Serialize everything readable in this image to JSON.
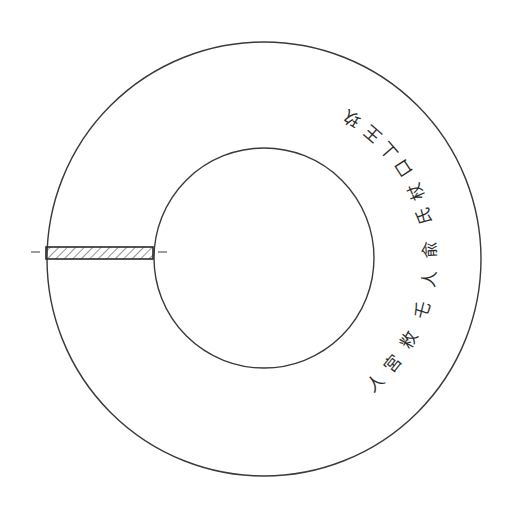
{
  "diagram": {
    "type": "bi-disc line drawing",
    "outer_ring": {
      "cx": 264,
      "cy": 259,
      "r": 217,
      "stroke": "#3a3a3a"
    },
    "inner_hole": {
      "cx": 264,
      "cy": 258,
      "r": 110,
      "stroke": "#3a3a3a"
    },
    "cross_section_bar": {
      "x1": 45,
      "x2": 153,
      "y": 247,
      "height": 12,
      "hatch": "diagonal"
    },
    "inscription": {
      "direction": "clockwise along right side of ring",
      "glyphs": [
        {
          "char": "玖",
          "angle": -58
        },
        {
          "char": "王",
          "angle": -49
        },
        {
          "char": "丄",
          "angle": -41
        },
        {
          "char": "口",
          "angle": -33
        },
        {
          "char": "杖",
          "angle": -24
        },
        {
          "char": "氏",
          "angle": -15
        },
        {
          "char": "兪",
          "angle": -3
        },
        {
          "char": "人",
          "angle": 7
        },
        {
          "char": "乇",
          "angle": 18
        },
        {
          "char": "敉",
          "angle": 29
        },
        {
          "char": "宮",
          "angle": 39
        },
        {
          "char": "人",
          "angle": 48
        }
      ]
    }
  }
}
